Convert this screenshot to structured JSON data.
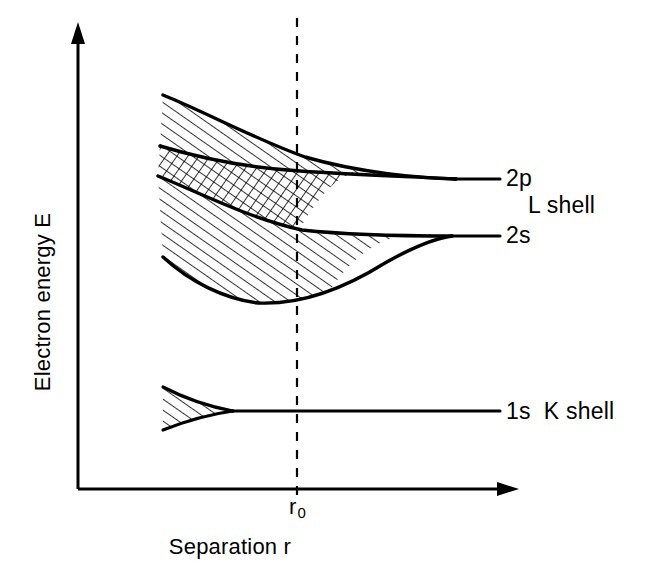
{
  "axes": {
    "y_label": "Electron energy E",
    "x_label": "Separation r",
    "x_tick_label_html": "r<sub>0</sub>",
    "x_tick_label": "r0"
  },
  "labels": {
    "band_2p": "2p",
    "band_2s": "2s",
    "shell_L": "L shell",
    "band_1s_shell_K": "1s  K shell"
  },
  "colors": {
    "ink": "#000000",
    "background": "#ffffff"
  },
  "chart_data": {
    "type": "line",
    "title": "",
    "subtitle": "",
    "xlabel": "Separation r",
    "ylabel": "Electron energy E",
    "xlim": [
      0,
      1
    ],
    "ylim": [
      0,
      1
    ],
    "grid": false,
    "legend": "right-inline-labels",
    "annotations": [
      {
        "text": "2p",
        "role": "band-asymptote-label",
        "at": "right"
      },
      {
        "text": "2s",
        "role": "band-asymptote-label",
        "at": "right"
      },
      {
        "text": "L shell",
        "role": "shell-group-label",
        "at": "right"
      },
      {
        "text": "1s  K shell",
        "role": "band-asymptote-label",
        "at": "right"
      },
      {
        "text": "r0",
        "role": "x-tick",
        "at": "equilibrium separation"
      }
    ],
    "equilibrium_marker": {
      "label": "r0",
      "x": 0.5,
      "style": "dashed-vertical"
    },
    "series": [
      {
        "name": "2p band upper edge",
        "hatch": "diagonal",
        "x": [
          0.2,
          0.27,
          0.35,
          0.45,
          0.55,
          0.66,
          0.78,
          0.86
        ],
        "y": [
          0.835,
          0.8,
          0.762,
          0.724,
          0.696,
          0.676,
          0.667,
          0.665
        ]
      },
      {
        "name": "2p band lower edge",
        "hatch": "diagonal",
        "x": [
          0.2,
          0.27,
          0.35,
          0.45,
          0.55,
          0.66,
          0.78,
          0.86
        ],
        "y": [
          0.748,
          0.72,
          0.69,
          0.672,
          0.663,
          0.662,
          0.664,
          0.665
        ]
      },
      {
        "name": "2s band upper edge",
        "hatch": "diagonal",
        "x": [
          0.2,
          0.27,
          0.35,
          0.45,
          0.55,
          0.66,
          0.78,
          0.86
        ],
        "y": [
          0.695,
          0.664,
          0.638,
          0.624,
          0.618,
          0.617,
          0.618,
          0.618
        ]
      },
      {
        "name": "2s band lower edge",
        "hatch": "diagonal",
        "x": [
          0.2,
          0.27,
          0.35,
          0.45,
          0.55,
          0.66,
          0.78,
          0.86
        ],
        "y": [
          0.551,
          0.5,
          0.47,
          0.478,
          0.53,
          0.578,
          0.608,
          0.618
        ]
      },
      {
        "name": "1s band upper edge",
        "hatch": "diagonal",
        "x": [
          0.2,
          0.24,
          0.3,
          0.4,
          0.6,
          0.86
        ],
        "y": [
          0.335,
          0.31,
          0.296,
          0.294,
          0.294,
          0.294
        ]
      },
      {
        "name": "1s band lower edge",
        "hatch": "diagonal",
        "x": [
          0.2,
          0.24,
          0.3,
          0.4,
          0.6,
          0.86
        ],
        "y": [
          0.262,
          0.278,
          0.291,
          0.294,
          0.294,
          0.294
        ]
      }
    ],
    "overlap_region": {
      "name": "2s-2p overlap",
      "hatch": "cross",
      "x_range": [
        0.2,
        0.46
      ]
    }
  }
}
